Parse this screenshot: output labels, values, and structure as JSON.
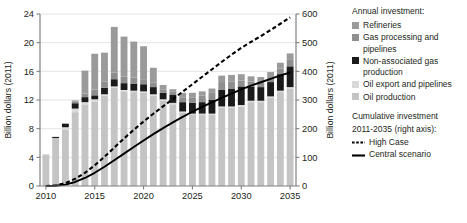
{
  "chart_data": {
    "type": "bar",
    "title": "",
    "subtitle": "",
    "xlabel": "",
    "ylabel": "Billion dollars (2011)",
    "y2label": "Billion dollars (2011)",
    "ylim": [
      0,
      24
    ],
    "y2lim": [
      0,
      600
    ],
    "xlim": [
      2009.4,
      2035.6
    ],
    "grid": true,
    "legend_position": "right",
    "yticks": [
      0,
      4,
      8,
      12,
      16,
      20,
      24
    ],
    "y2ticks": [
      0,
      100,
      200,
      300,
      400,
      500,
      600
    ],
    "xticks": [
      2010,
      2015,
      2020,
      2025,
      2030,
      2035
    ],
    "categories": [
      2010,
      2011,
      2012,
      2013,
      2014,
      2015,
      2016,
      2017,
      2018,
      2019,
      2020,
      2021,
      2022,
      2023,
      2024,
      2025,
      2026,
      2027,
      2028,
      2029,
      2030,
      2031,
      2032,
      2033,
      2034,
      2035
    ],
    "series": [
      {
        "name": "Oil production",
        "color": "#c4c4c4",
        "values": [
          4.4,
          6.7,
          7.9,
          10.3,
          11.3,
          11.8,
          12.6,
          13.7,
          13.2,
          13.1,
          13.0,
          12.6,
          11.9,
          11.4,
          10.2,
          9.9,
          9.9,
          9.9,
          10.9,
          10.9,
          11.1,
          11.7,
          11.7,
          12.3,
          13.1,
          13.6
        ]
      },
      {
        "name": "Oil export and pipelines",
        "color": "#d9d9d9",
        "values": [
          0.0,
          0.0,
          0.3,
          0.5,
          0.4,
          0.3,
          0.2,
          0.2,
          0.2,
          0.2,
          0.2,
          0.2,
          0.2,
          0.2,
          0.2,
          0.2,
          0.2,
          0.2,
          0.2,
          0.2,
          0.2,
          0.2,
          0.2,
          0.2,
          0.2,
          0.2
        ]
      },
      {
        "name": "Non-associated gas production",
        "color": "#1a1a1a",
        "values": [
          0.0,
          0.15,
          0.45,
          0.75,
          0.7,
          0.55,
          0.9,
          1.0,
          0.95,
          1.0,
          1.0,
          1.0,
          0.9,
          1.1,
          1.3,
          1.5,
          1.6,
          1.9,
          2.3,
          2.5,
          2.6,
          2.0,
          1.9,
          2.0,
          2.3,
          2.9
        ]
      },
      {
        "name": "Gas processing and pipelines",
        "color": "#8e8e8e",
        "values": [
          0.0,
          0.0,
          0.1,
          0.2,
          0.5,
          0.8,
          0.9,
          0.9,
          0.9,
          0.85,
          0.7,
          0.6,
          0.5,
          0.5,
          0.6,
          0.7,
          0.9,
          1.0,
          1.1,
          1.0,
          0.8,
          0.7,
          0.7,
          0.7,
          0.8,
          0.9
        ]
      },
      {
        "name": "Refineries",
        "color": "#9a9a9a",
        "values": [
          0.0,
          0.0,
          0.0,
          0.2,
          3.2,
          5.0,
          4.0,
          6.4,
          5.6,
          5.0,
          4.6,
          2.1,
          0.6,
          0.3,
          0.7,
          0.7,
          0.6,
          0.6,
          0.9,
          0.9,
          0.9,
          0.7,
          0.7,
          0.7,
          0.8,
          0.9
        ]
      }
    ],
    "lines": [
      {
        "name": "High Case",
        "style": "dashed",
        "axis": "right",
        "color": "#000000",
        "x": [
          2010,
          2011,
          2012,
          2013,
          2014,
          2015,
          2016,
          2017,
          2018,
          2019,
          2020,
          2021,
          2022,
          2023,
          2024,
          2025,
          2026,
          2027,
          2028,
          2029,
          2030,
          2031,
          2032,
          2033,
          2034,
          2035
        ],
        "y": [
          0,
          2,
          10,
          25,
          46,
          72,
          102,
          134,
          166,
          196,
          225,
          252,
          278,
          303,
          329,
          355,
          381,
          407,
          433,
          458,
          482,
          503,
          523,
          544,
          566,
          588
        ]
      },
      {
        "name": "Central scenario",
        "style": "solid",
        "axis": "right",
        "color": "#000000",
        "x": [
          2010,
          2011,
          2012,
          2013,
          2014,
          2015,
          2016,
          2017,
          2018,
          2019,
          2020,
          2021,
          2022,
          2023,
          2024,
          2025,
          2026,
          2027,
          2028,
          2029,
          2030,
          2031,
          2032,
          2033,
          2034,
          2035
        ],
        "y": [
          0,
          1,
          5,
          14,
          28,
          46,
          67,
          90,
          113,
          136,
          159,
          181,
          202,
          222,
          241,
          259,
          276,
          292,
          307,
          322,
          337,
          350,
          362,
          374,
          386,
          396
        ]
      }
    ]
  },
  "legend": {
    "heading": "Annual investment:",
    "items": [
      {
        "label": "Refineries",
        "color": "#9a9a9a"
      },
      {
        "label": "Gas processing and pipelines",
        "color": "#8e8e8e"
      },
      {
        "label": "Non-associated gas production",
        "color": "#1a1a1a"
      },
      {
        "label": "Oil export and pipelines",
        "color": "#d9d9d9"
      },
      {
        "label": "Oil production",
        "color": "#c4c4c4"
      }
    ],
    "heading2_line1": "Cumulative investment",
    "heading2_line2": "2011-2035 (right axis):",
    "lines": [
      {
        "label": "High Case",
        "style": "dashed"
      },
      {
        "label": "Central scenario",
        "style": "solid"
      }
    ]
  },
  "axes": {
    "left_title": "Billion dollars (2011)",
    "right_title": "Billion dollars (2011)"
  }
}
